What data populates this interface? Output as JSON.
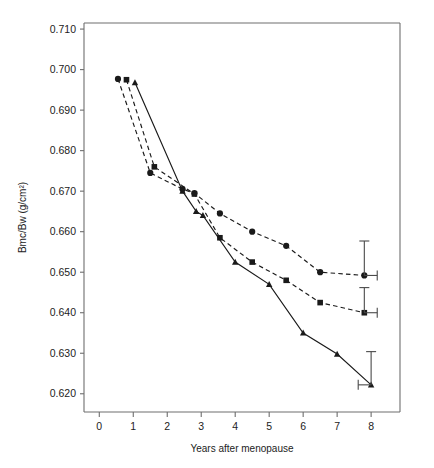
{
  "chart_data": {
    "type": "line",
    "title": "",
    "xlabel": "Years after menopause",
    "ylabel": "Bmc/Bw (g/cm²)",
    "xlim": [
      -0.45,
      8.85
    ],
    "ylim": [
      0.6155,
      0.7115
    ],
    "xticks": [
      0,
      1,
      2,
      3,
      4,
      5,
      6,
      7,
      8
    ],
    "xtick_labels": [
      "0",
      "1",
      "2",
      "3",
      "4",
      "5",
      "6",
      "7",
      "8"
    ],
    "yticks": [
      0.62,
      0.63,
      0.64,
      0.65,
      0.66,
      0.67,
      0.68,
      0.69,
      0.7,
      0.71
    ],
    "ytick_labels": [
      "0.620",
      "0.630",
      "0.640",
      "0.650",
      "0.660",
      "0.670",
      "0.680",
      "0.690",
      "0.700",
      "0.710"
    ],
    "grid": false,
    "legend": "none",
    "series": [
      {
        "name": "circle-series",
        "marker": "circle",
        "linestyle": "dashed",
        "color": "#1a1a1a",
        "x": [
          0.55,
          1.5,
          2.45,
          2.8,
          3.55,
          4.5,
          5.5,
          6.5,
          7.8
        ],
        "y": [
          0.6977,
          0.6745,
          0.6705,
          0.6695,
          0.6645,
          0.66,
          0.6565,
          0.65,
          0.6492
        ],
        "error_bar": {
          "x": 7.8,
          "y": 0.6492,
          "upper": 0.0085,
          "lower": 0.0,
          "x_whisker": 0.38
        }
      },
      {
        "name": "square-series",
        "marker": "square",
        "linestyle": "dashed",
        "color": "#1a1a1a",
        "x": [
          0.8,
          1.62,
          2.8,
          3.55,
          4.5,
          5.5,
          6.5,
          7.8
        ],
        "y": [
          0.6975,
          0.676,
          0.6693,
          0.6585,
          0.6525,
          0.648,
          0.6425,
          0.64
        ],
        "error_bar": {
          "x": 7.8,
          "y": 0.64,
          "upper": 0.0062,
          "lower": 0.0,
          "x_whisker": 0.38
        }
      },
      {
        "name": "triangle-series",
        "marker": "triangle",
        "linestyle": "solid",
        "color": "#1a1a1a",
        "x": [
          1.05,
          2.45,
          2.85,
          3.05,
          4.0,
          5.0,
          6.0,
          7.0,
          8.0
        ],
        "y": [
          0.6968,
          0.67,
          0.665,
          0.664,
          0.6525,
          0.647,
          0.635,
          0.6298,
          0.6222
        ],
        "error_bar": {
          "x": 8.0,
          "y": 0.6222,
          "upper": 0.0082,
          "lower": 0.0,
          "x_whisker": -0.38
        }
      }
    ]
  }
}
